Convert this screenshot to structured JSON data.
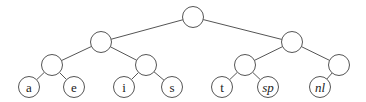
{
  "diagram": {
    "type": "binary-tree",
    "colors": {
      "stroke": "#555555",
      "fill": "#ffffff",
      "text": "#222222"
    },
    "node_radius": 10.5,
    "nodes": [
      {
        "id": "root",
        "x": 193,
        "y": 17,
        "label": ""
      },
      {
        "id": "n0",
        "x": 101,
        "y": 42,
        "label": ""
      },
      {
        "id": "n1",
        "x": 292,
        "y": 42,
        "label": ""
      },
      {
        "id": "n00",
        "x": 52,
        "y": 65,
        "label": ""
      },
      {
        "id": "n01",
        "x": 146,
        "y": 65,
        "label": ""
      },
      {
        "id": "n10",
        "x": 245,
        "y": 65,
        "label": ""
      },
      {
        "id": "n11",
        "x": 339,
        "y": 65,
        "label": ""
      },
      {
        "id": "leaf-a",
        "x": 29,
        "y": 87,
        "label": "a",
        "italic": false
      },
      {
        "id": "leaf-e",
        "x": 74,
        "y": 87,
        "label": "e",
        "italic": false
      },
      {
        "id": "leaf-i",
        "x": 124,
        "y": 87,
        "label": "i",
        "italic": false
      },
      {
        "id": "leaf-s",
        "x": 172,
        "y": 87,
        "label": "s",
        "italic": false
      },
      {
        "id": "leaf-t",
        "x": 222,
        "y": 87,
        "label": "t",
        "italic": false
      },
      {
        "id": "leaf-sp",
        "x": 268,
        "y": 87,
        "label": "sp",
        "italic": true
      },
      {
        "id": "leaf-nl",
        "x": 320,
        "y": 87,
        "label": "nl",
        "italic": true
      }
    ],
    "edges": [
      [
        "root",
        "n0"
      ],
      [
        "root",
        "n1"
      ],
      [
        "n0",
        "n00"
      ],
      [
        "n0",
        "n01"
      ],
      [
        "n1",
        "n10"
      ],
      [
        "n1",
        "n11"
      ],
      [
        "n00",
        "leaf-a"
      ],
      [
        "n00",
        "leaf-e"
      ],
      [
        "n01",
        "leaf-i"
      ],
      [
        "n01",
        "leaf-s"
      ],
      [
        "n10",
        "leaf-t"
      ],
      [
        "n10",
        "leaf-sp"
      ],
      [
        "n11",
        "leaf-nl"
      ]
    ]
  }
}
